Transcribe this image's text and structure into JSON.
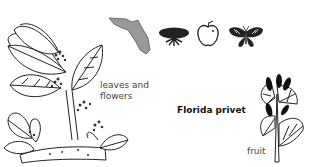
{
  "title": "Florida privet",
  "labels": {
    "leaves_flowers_line1": "leaves and",
    "leaves_flowers_line2": "flowers",
    "fruit": "fruit"
  },
  "icons": [
    {
      "name": "florida-map-icon",
      "color": "#999999"
    },
    {
      "name": "shrub-icon",
      "color": "#222222"
    },
    {
      "name": "apple-icon",
      "color": "#222222"
    },
    {
      "name": "butterfly-icon",
      "color": "#222222"
    }
  ]
}
